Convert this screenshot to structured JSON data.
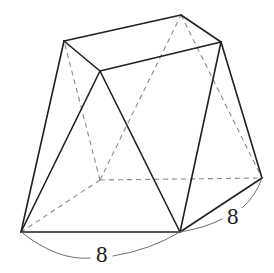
{
  "figure": {
    "type": "3d-polyhedron-line-drawing",
    "background_color": "#ffffff",
    "solid_edge_color": "#231f20",
    "hidden_edge_color": "#8a8a8a",
    "arc_color": "#6f6f6f",
    "label_color": "#1c1c1c",
    "vertices": {
      "top_left": [
        64,
        41
      ],
      "top_back": [
        181,
        15
      ],
      "top_right": [
        221,
        42
      ],
      "top_front": [
        100,
        71
      ],
      "bottom_left": [
        21,
        232
      ],
      "bottom_front": [
        180,
        232
      ],
      "bottom_right": [
        262,
        178
      ],
      "bottom_back_hidden": [
        100,
        180
      ]
    },
    "solid_edges": [
      [
        [
          64,
          41
        ],
        [
          181,
          15
        ]
      ],
      [
        [
          181,
          15
        ],
        [
          221,
          42
        ]
      ],
      [
        [
          221,
          42
        ],
        [
          100,
          71
        ]
      ],
      [
        [
          100,
          71
        ],
        [
          64,
          41
        ]
      ],
      [
        [
          21,
          232
        ],
        [
          180,
          232
        ]
      ],
      [
        [
          180,
          232
        ],
        [
          262,
          178
        ]
      ],
      [
        [
          21,
          232
        ],
        [
          64,
          41
        ]
      ],
      [
        [
          21,
          232
        ],
        [
          100,
          71
        ]
      ],
      [
        [
          100,
          71
        ],
        [
          180,
          232
        ]
      ],
      [
        [
          180,
          232
        ],
        [
          221,
          42
        ]
      ],
      [
        [
          221,
          42
        ],
        [
          262,
          178
        ]
      ],
      [
        [
          181,
          15
        ],
        [
          221,
          42
        ]
      ]
    ],
    "hidden_edges": [
      [
        [
          100,
          180
        ],
        [
          262,
          178
        ]
      ],
      [
        [
          100,
          180
        ],
        [
          21,
          232
        ]
      ],
      [
        [
          100,
          180
        ],
        [
          64,
          41
        ]
      ],
      [
        [
          100,
          180
        ],
        [
          181,
          15
        ]
      ],
      [
        [
          181,
          15
        ],
        [
          262,
          178
        ]
      ]
    ],
    "measurements": [
      {
        "name": "front-bottom-edge",
        "label": "8",
        "from": [
          21,
          232
        ],
        "to": [
          180,
          232
        ],
        "arc_control": [
          101,
          284
        ],
        "label_position": [
          93,
          243
        ]
      },
      {
        "name": "right-bottom-edge",
        "label": "8",
        "from": [
          180,
          232
        ],
        "to": [
          262,
          178
        ],
        "arc_control": [
          214,
          226
        ],
        "label_position": [
          224,
          205
        ]
      }
    ]
  }
}
